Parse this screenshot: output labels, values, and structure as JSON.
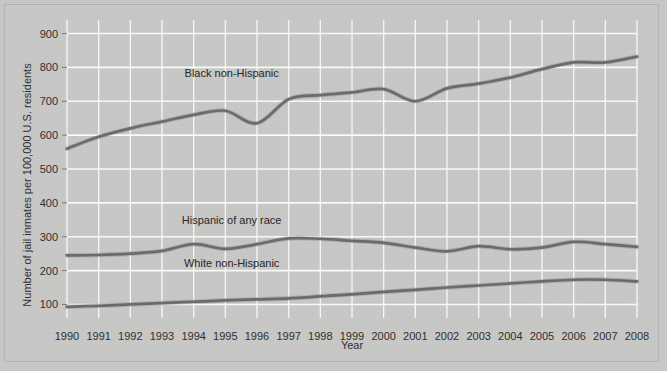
{
  "chart_data": {
    "type": "line",
    "title": "",
    "xlabel": "Year",
    "ylabel": "Number of jail inmates per 100,000 U.S. residents",
    "categories": [
      1990,
      1991,
      1992,
      1993,
      1994,
      1995,
      1996,
      1997,
      1998,
      1999,
      2000,
      2001,
      2002,
      2003,
      2004,
      2005,
      2006,
      2007,
      2008
    ],
    "xtick_labels": [
      "1990",
      "1991",
      "1992",
      "1993",
      "1994",
      "1995",
      "1996",
      "1997",
      "1998",
      "1999",
      "2000",
      "2001",
      "2002",
      "2003",
      "2004",
      "2005",
      "2006",
      "2007",
      "2008"
    ],
    "ytick_labels": [
      "100",
      "200",
      "300",
      "400",
      "500",
      "600",
      "700",
      "800",
      "900"
    ],
    "ytick_values": [
      100,
      200,
      300,
      400,
      500,
      600,
      700,
      800,
      900
    ],
    "ylim": [
      60,
      940
    ],
    "xlim": [
      1990,
      2008
    ],
    "grid": true,
    "grid_color": "#ffffff",
    "legend_position": "inline-annotations",
    "series": [
      {
        "name": "Black non-Hispanic",
        "color": "#6b6b6b",
        "label_x": 1995.2,
        "label_y": 772,
        "values": [
          560,
          595,
          620,
          640,
          660,
          672,
          635,
          706,
          718,
          726,
          736,
          700,
          738,
          752,
          770,
          795,
          815,
          815,
          832
        ]
      },
      {
        "name": "Hispanic of any race",
        "color": "#6b6b6b",
        "label_x": 1995.2,
        "label_y": 338,
        "values": [
          245,
          246,
          250,
          258,
          278,
          264,
          278,
          295,
          294,
          288,
          282,
          268,
          257,
          272,
          263,
          268,
          285,
          278,
          270
        ]
      },
      {
        "name": "White non-Hispanic",
        "color": "#6b6b6b",
        "label_x": 1995.2,
        "label_y": 212,
        "values": [
          93,
          96,
          100,
          104,
          108,
          112,
          115,
          118,
          124,
          130,
          137,
          143,
          150,
          156,
          162,
          168,
          173,
          173,
          168
        ]
      }
    ]
  }
}
